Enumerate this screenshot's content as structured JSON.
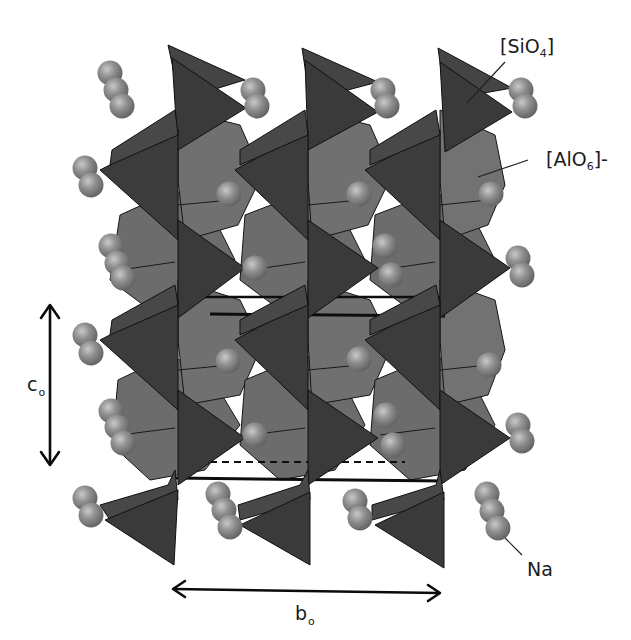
{
  "figure": {
    "colors": {
      "background": "#ffffff",
      "tetrahedron_fill": "#3a3a3a",
      "tetrahedron_light": "#474747",
      "octahedron_fill": "#6a6a6a",
      "octahedron_light": "#7a7a7a",
      "sphere_fill": "#8c8c8c",
      "sphere_highlight": "#c4c4c4",
      "edge_color": "#111111",
      "text_color": "#1a1a1a"
    }
  },
  "labels": {
    "sio4": {
      "prefix": "[SiO",
      "sub": "4",
      "suffix": "]"
    },
    "alo6": {
      "prefix": "[AlO",
      "sub": "6",
      "suffix": "]-"
    },
    "na": {
      "text": "Na"
    },
    "c_axis": {
      "letter": "c",
      "sub": "o"
    },
    "b_axis": {
      "letter": "b",
      "sub": "o"
    }
  },
  "legend_entries": [
    {
      "label": "[SiO4]",
      "shape": "tetrahedron",
      "color": "#3a3a3a"
    },
    {
      "label": "[AlO6]-",
      "shape": "octahedron",
      "color": "#6a6a6a"
    },
    {
      "label": "Na",
      "shape": "sphere",
      "color": "#8c8c8c"
    }
  ],
  "axes": [
    {
      "name": "c_o",
      "direction": "vertical",
      "from": [
        50,
        305
      ],
      "to": [
        50,
        465
      ]
    },
    {
      "name": "b_o",
      "direction": "horizontal",
      "from": [
        172,
        589
      ],
      "to": [
        441,
        593
      ]
    }
  ]
}
